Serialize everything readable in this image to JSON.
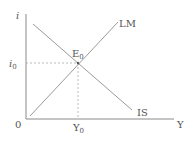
{
  "diagram": {
    "axes": {
      "y_label": "i",
      "x_label": "Y",
      "origin_label": "0"
    },
    "curves": [
      {
        "name": "LM",
        "label": "LM",
        "direction": "upward-sloping"
      },
      {
        "name": "IS",
        "label": "IS",
        "direction": "downward-sloping"
      }
    ],
    "equilibrium": {
      "label": "E",
      "label_sub": "0",
      "i_label": "i",
      "i_sub": "0",
      "y_label": "Y",
      "y_sub": "0"
    },
    "colors": {
      "axis": "#8a8a8a",
      "curve": "#9a9a9a",
      "dashed": "#aaaaaa",
      "text": "#555555"
    }
  }
}
